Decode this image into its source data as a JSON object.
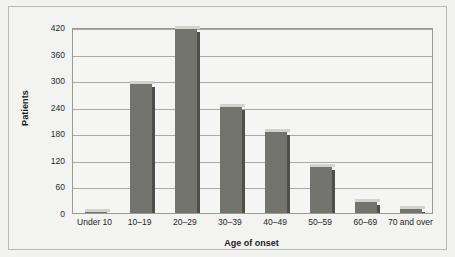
{
  "chart_data": {
    "type": "bar",
    "title": "",
    "xlabel": "Age of onset",
    "ylabel": "Patients",
    "categories": [
      "Under 10",
      "10–19",
      "20–29",
      "30–39",
      "40–49",
      "50–59",
      "60–69",
      "70 and over"
    ],
    "values": [
      2,
      292,
      415,
      240,
      184,
      103,
      25,
      8
    ],
    "series": [
      {
        "name": "Patients",
        "values": [
          2,
          292,
          415,
          240,
          184,
          103,
          25,
          8
        ]
      }
    ],
    "ylim": [
      0,
      420
    ],
    "yticks": [
      0,
      60,
      120,
      180,
      240,
      300,
      360,
      420
    ],
    "ytick_labels": [
      "0",
      "60",
      "120",
      "180",
      "240",
      "300",
      "360",
      "420"
    ],
    "grid": "horizontal",
    "legend": "none",
    "bar_color": "#74746f",
    "bar_shadow_color": "#4e4e4a",
    "bar_highlight_color": "#d2d2ce",
    "plot_background": "#f5f5f3",
    "figure_background": "#f2f2f0",
    "gridline_color": "#a9a9a6",
    "axis_color": "#9a9a97"
  }
}
